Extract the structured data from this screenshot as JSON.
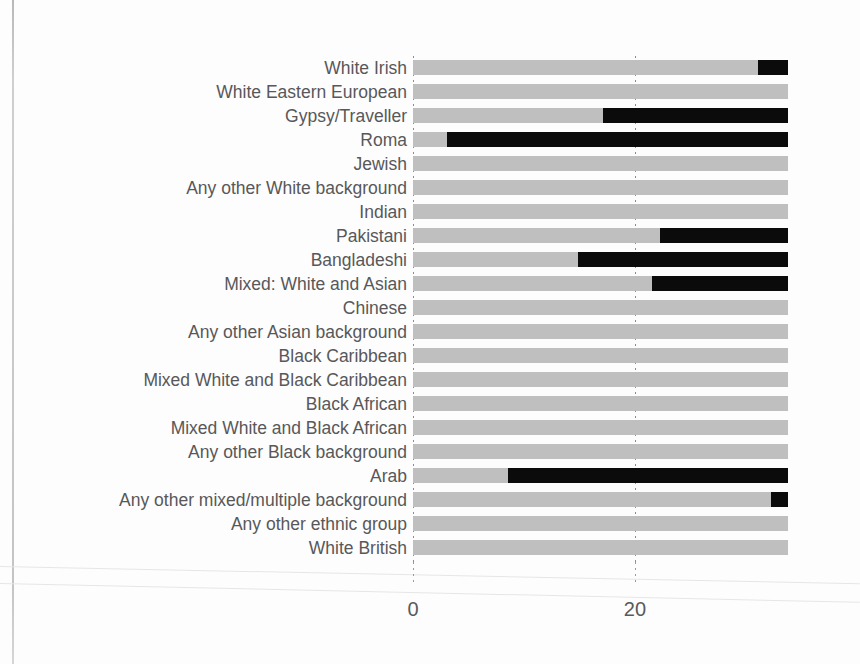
{
  "chart_data": {
    "type": "bar",
    "orientation": "horizontal",
    "title": "",
    "xlabel": "",
    "ylabel": "",
    "xlim": [
      0,
      33.8
    ],
    "xticks": [
      0,
      20
    ],
    "xtick_labels": [
      "0",
      "20"
    ],
    "grid": true,
    "legend": "none",
    "track_max": 33.8,
    "colors": {
      "track": "#bfbfbf",
      "fill": "#0b0b0b",
      "label_text": "#58585a",
      "tick_text": "#595a5c",
      "gridline": "#8c8c8c"
    },
    "note": "Each row shows a full-length grey track with a black highlighted segment spanning from the start value to the right end of the track. Rows with no black segment have no highlighted range.",
    "categories": [
      "White Irish",
      "White Eastern European",
      "Gypsy/Traveller",
      "Roma",
      "Jewish",
      "Any other White background",
      "Indian",
      "Pakistani",
      "Bangladeshi",
      "Mixed: White and Asian",
      "Chinese",
      "Any other Asian background",
      "Black Caribbean",
      "Mixed White and Black Caribbean",
      "Black African",
      "Mixed White and Black African",
      "Any other Black background",
      "Arab",
      "Any other mixed/multiple background",
      "Any other ethnic group",
      "White British"
    ],
    "segments": [
      {
        "category": "White Irish",
        "start": 31.1,
        "end": 33.8
      },
      {
        "category": "White Eastern European",
        "start": null,
        "end": null
      },
      {
        "category": "Gypsy/Traveller",
        "start": 17.1,
        "end": 33.8
      },
      {
        "category": "Roma",
        "start": 3.1,
        "end": 33.8
      },
      {
        "category": "Jewish",
        "start": null,
        "end": null
      },
      {
        "category": "Any other White background",
        "start": null,
        "end": null
      },
      {
        "category": "Indian",
        "start": null,
        "end": null
      },
      {
        "category": "Pakistani",
        "start": 22.3,
        "end": 33.8
      },
      {
        "category": "Bangladeshi",
        "start": 14.9,
        "end": 33.8
      },
      {
        "category": "Mixed: White and Asian",
        "start": 21.5,
        "end": 33.8
      },
      {
        "category": "Chinese",
        "start": null,
        "end": null
      },
      {
        "category": "Any other Asian background",
        "start": null,
        "end": null
      },
      {
        "category": "Black Caribbean",
        "start": null,
        "end": null
      },
      {
        "category": "Mixed White and Black Caribbean",
        "start": null,
        "end": null
      },
      {
        "category": "Black African",
        "start": null,
        "end": null
      },
      {
        "category": "Mixed White and Black African",
        "start": null,
        "end": null
      },
      {
        "category": "Any other Black background",
        "start": null,
        "end": null
      },
      {
        "category": "Arab",
        "start": 8.6,
        "end": 33.8
      },
      {
        "category": "Any other mixed/multiple background",
        "start": 32.3,
        "end": 33.8
      },
      {
        "category": "Any other ethnic group",
        "start": null,
        "end": null
      },
      {
        "category": "White British",
        "start": null,
        "end": null
      }
    ]
  }
}
